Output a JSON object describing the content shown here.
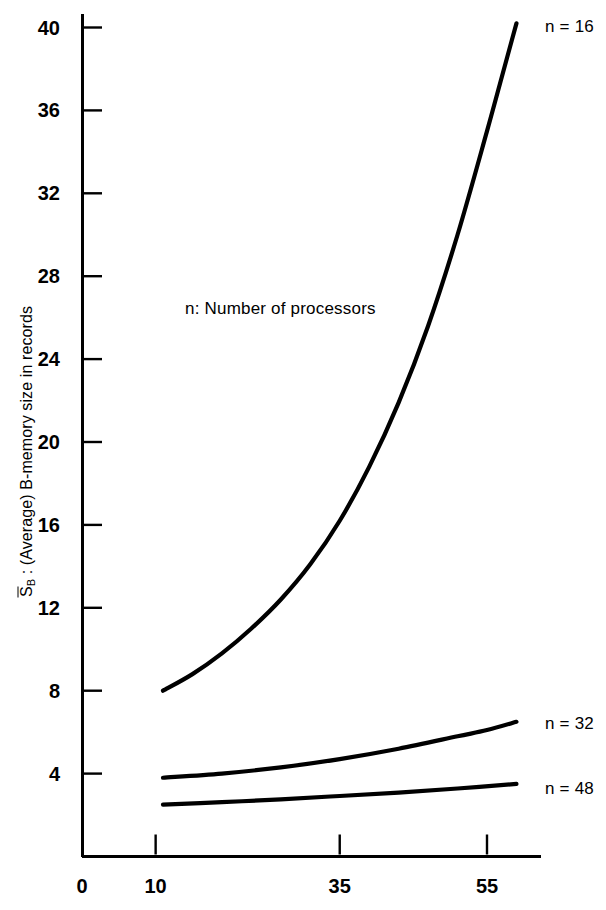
{
  "chart_data": {
    "type": "line",
    "title": "",
    "xlabel": "",
    "ylabel": "S̅B : (Average) B-memory size in records",
    "ylabel_parts": {
      "symbol": "S",
      "subscript": "B",
      "rest": " : (Average) B-memory size in records"
    },
    "annotation": "n: Number of processors",
    "grid": false,
    "legend_position": "right-inline",
    "xlim": [
      0,
      62
    ],
    "ylim": [
      0,
      42
    ],
    "xticks": [
      0,
      10,
      35,
      55
    ],
    "xtick_labels": [
      "0",
      "10",
      "35",
      "55"
    ],
    "yticks": [
      4,
      8,
      12,
      16,
      20,
      24,
      28,
      32,
      36,
      40
    ],
    "ytick_labels": [
      "4",
      "8",
      "12",
      "16",
      "20",
      "24",
      "28",
      "32",
      "36",
      "40"
    ],
    "series": [
      {
        "name": "n = 16",
        "label": "n = 16",
        "color": "#000000",
        "x": [
          11.0,
          15.0,
          19.0,
          23.0,
          27.0,
          31.0,
          35.0,
          39.0,
          43.0,
          47.0,
          51.0,
          55.0,
          57.0,
          58.0,
          59.0
        ],
        "values": [
          8.0,
          8.8,
          9.8,
          11.0,
          12.4,
          14.1,
          16.2,
          18.8,
          21.9,
          25.6,
          30.0,
          35.0,
          37.6,
          38.9,
          40.2
        ]
      },
      {
        "name": "n = 32",
        "label": "n = 32",
        "color": "#000000",
        "x": [
          11.0,
          19.0,
          27.0,
          35.0,
          43.0,
          51.0,
          55.0,
          59.0
        ],
        "values": [
          3.8,
          4.0,
          4.3,
          4.7,
          5.2,
          5.8,
          6.1,
          6.5
        ]
      },
      {
        "name": "n = 48",
        "label": "n = 48",
        "color": "#000000",
        "x": [
          11.0,
          19.0,
          27.0,
          35.0,
          43.0,
          51.0,
          59.0
        ],
        "values": [
          2.5,
          2.62,
          2.76,
          2.92,
          3.08,
          3.28,
          3.5
        ]
      }
    ]
  }
}
